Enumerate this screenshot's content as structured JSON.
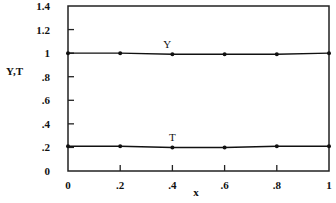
{
  "chart_data": {
    "type": "line",
    "title": "",
    "xlabel": "x",
    "ylabel": "Y,T",
    "xlim": [
      0,
      1
    ],
    "ylim": [
      0,
      1.4
    ],
    "x_ticks": [
      0,
      0.2,
      0.4,
      0.6,
      0.8,
      1
    ],
    "x_tick_labels": [
      "0",
      ".2",
      ".4",
      ".6",
      ".8",
      "1"
    ],
    "y_ticks": [
      0,
      0.2,
      0.4,
      0.6,
      0.8,
      1,
      1.2,
      1.4
    ],
    "y_tick_labels": [
      "0",
      ".2",
      ".4",
      ".6",
      ".8",
      "1",
      "1.2",
      "1.4"
    ],
    "grid": false,
    "legend": "inline labels above each line",
    "series": [
      {
        "name": "Y",
        "x": [
          0,
          0.2,
          0.4,
          0.6,
          0.8,
          1
        ],
        "values": [
          1.0,
          1.0,
          0.99,
          0.99,
          0.99,
          1.0
        ],
        "label_at_x": 0.38
      },
      {
        "name": "T",
        "x": [
          0,
          0.2,
          0.4,
          0.6,
          0.8,
          1
        ],
        "values": [
          0.21,
          0.21,
          0.2,
          0.2,
          0.21,
          0.21
        ],
        "label_at_x": 0.4
      }
    ],
    "colors": {
      "line": "#111111",
      "frame": "#222222"
    }
  }
}
